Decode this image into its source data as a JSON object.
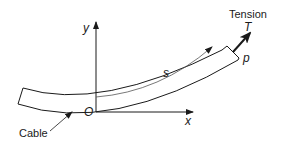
{
  "diagram": {
    "labels": {
      "y_axis": "y",
      "x_axis": "x",
      "origin": "O",
      "arc_length": "s",
      "tension_title": "Tension",
      "tension_symbol": "T",
      "point": "p",
      "cable": "Cable"
    },
    "colors": {
      "stroke": "#1a1a1a",
      "arc_line": "#555555",
      "background": "#ffffff"
    }
  }
}
